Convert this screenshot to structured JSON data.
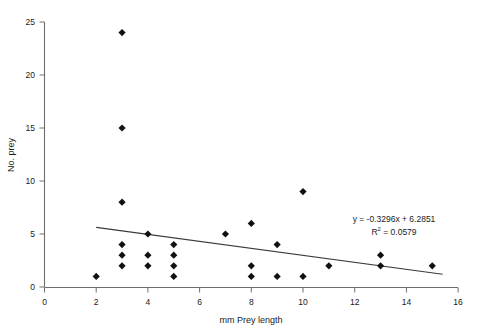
{
  "chart_data": {
    "type": "scatter",
    "title": "",
    "xlabel": "mm Prey length",
    "ylabel": "No. prey",
    "xlim": [
      0,
      16
    ],
    "ylim": [
      0,
      25
    ],
    "xticks": [
      0,
      2,
      4,
      6,
      8,
      10,
      12,
      14,
      16
    ],
    "yticks": [
      0,
      5,
      10,
      15,
      20,
      25
    ],
    "grid": false,
    "legend": null,
    "marker": "diamond",
    "marker_color": "#111111",
    "points": [
      {
        "x": 2,
        "y": 1
      },
      {
        "x": 3,
        "y": 24
      },
      {
        "x": 3,
        "y": 15
      },
      {
        "x": 3,
        "y": 8
      },
      {
        "x": 3,
        "y": 4
      },
      {
        "x": 3,
        "y": 3
      },
      {
        "x": 3,
        "y": 2
      },
      {
        "x": 4,
        "y": 5
      },
      {
        "x": 4,
        "y": 3
      },
      {
        "x": 4,
        "y": 2
      },
      {
        "x": 5,
        "y": 4
      },
      {
        "x": 5,
        "y": 3
      },
      {
        "x": 5,
        "y": 2
      },
      {
        "x": 5,
        "y": 1
      },
      {
        "x": 7,
        "y": 5
      },
      {
        "x": 8,
        "y": 6
      },
      {
        "x": 8,
        "y": 2
      },
      {
        "x": 8,
        "y": 1
      },
      {
        "x": 9,
        "y": 4
      },
      {
        "x": 9,
        "y": 1
      },
      {
        "x": 10,
        "y": 9
      },
      {
        "x": 10,
        "y": 1
      },
      {
        "x": 11,
        "y": 2
      },
      {
        "x": 13,
        "y": 3
      },
      {
        "x": 13,
        "y": 2
      },
      {
        "x": 15,
        "y": 2
      }
    ],
    "trendline": {
      "slope": -0.3296,
      "intercept": 6.2851,
      "x_start": 2,
      "x_end": 15.4,
      "color": "#3a3a3a"
    },
    "annotations": {
      "equation": "y = -0.3296x + 6.2851",
      "r_squared_prefix": "R",
      "r_squared_sup": "2",
      "r_squared_value": " = 0.0579"
    }
  }
}
